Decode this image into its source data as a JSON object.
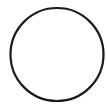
{
  "shape": {
    "type": "circle",
    "cx": 57,
    "cy": 54.5,
    "r": 46.5,
    "stroke": "#1a1a1a",
    "stroke_width": 2.2,
    "fill": "#ffffff"
  },
  "canvas": {
    "width": 107,
    "height": 108,
    "background": "#ffffff"
  }
}
